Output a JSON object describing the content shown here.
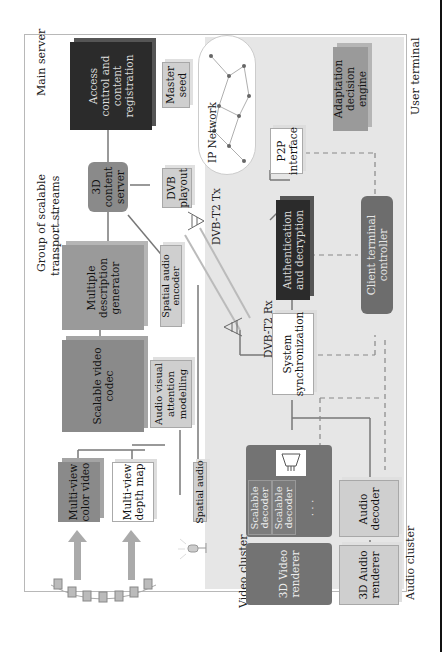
{
  "diagram": {
    "zones": {
      "main_server": "Main server",
      "user_terminal": "User terminal",
      "video_cluster": "Video cluster",
      "audio_cluster": "Audio cluster",
      "ip_network": "IP Network",
      "group_streams_line1": "Group of scalable",
      "group_streams_line2": "transport streams"
    },
    "server_nodes": {
      "access_control": [
        "Access",
        "control and",
        "content",
        "registration"
      ],
      "master_seed": [
        "Master",
        "seed"
      ],
      "content_server": [
        "3D",
        "content",
        "server"
      ],
      "dvb_playout": [
        "DVB",
        "playout"
      ],
      "dvb_tx": "DVB-T2 Tx",
      "md_generator": [
        "Multiple",
        "description",
        "generator"
      ],
      "svc": [
        "Scalable video",
        "codec"
      ],
      "spatial_audio_encoder": [
        "Spatial audio",
        "encoder"
      ],
      "av_attention": [
        "Audio visual",
        "attention",
        "modelling"
      ],
      "mv_color": [
        "Multi-view",
        "color video"
      ],
      "mv_depth": [
        "Multi-view",
        "depth map"
      ],
      "spatial_audio": "Spatial audio"
    },
    "terminal_nodes": {
      "p2p": [
        "P2P",
        "interface"
      ],
      "adaptation": [
        "Adaptation",
        "decision",
        "engine"
      ],
      "auth": [
        "Authentication",
        "and decryption"
      ],
      "client_controller": [
        "Client terminal",
        "controller"
      ],
      "dvb_rx": "DVB-T2 Rx",
      "sys_sync": [
        "System",
        "synchronization"
      ],
      "scalable_decoder_1": [
        "Scalable",
        "decoder"
      ],
      "scalable_decoder_2": [
        "Scalable",
        "decoder"
      ],
      "decoder_ellipsis": "· · ·",
      "video_renderer": [
        "3D Video",
        "renderer"
      ],
      "audio_decoder": [
        "Audio",
        "decoder"
      ],
      "audio_renderer": [
        "3D Audio",
        "renderer"
      ]
    },
    "icons": [
      "camera-array-icon",
      "microphone-icon",
      "broadcast-tower-icon",
      "display-icon",
      "network-cloud-icon"
    ]
  }
}
